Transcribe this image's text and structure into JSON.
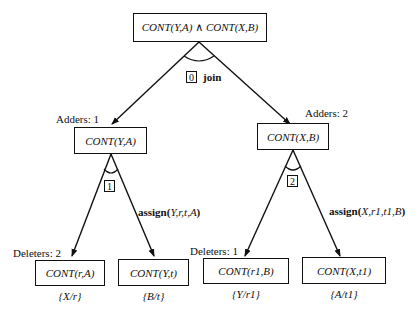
{
  "root": {
    "label": "CONT(Y,A) ∧ CONT(X,B)"
  },
  "op0": {
    "index": "0",
    "name": "join"
  },
  "left": {
    "adders_label": "Adders:  1",
    "node": "CONT(Y,A)",
    "op_index": "1",
    "assign_name": "assign(",
    "assign_args": "Y,r,t,A",
    "assign_close": ")",
    "deleters_label": "Deleters:  2",
    "children": [
      {
        "node": "CONT(r,A)",
        "binding": "{X/r}"
      },
      {
        "node": "CONT(Y,t)",
        "binding": "{B/t}"
      }
    ]
  },
  "right": {
    "adders_label": "Adders:  2",
    "node": "CONT(X,B)",
    "op_index": "2",
    "assign_name": "assign(",
    "assign_args": "X,r1,t1,B",
    "assign_close": ")",
    "deleters_label": "Deleters:  1",
    "children": [
      {
        "node": "CONT(r1,B)",
        "binding": "{Y/r1}"
      },
      {
        "node": "CONT(X,t1)",
        "binding": "{A/t1}"
      }
    ]
  }
}
